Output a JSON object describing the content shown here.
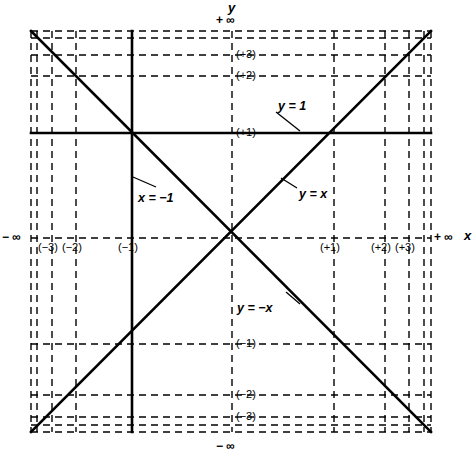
{
  "figure": {
    "kind": "compactified-cartesian-plane",
    "background": "#ffffff",
    "ink": "#000000",
    "width": 475,
    "height": 460
  },
  "axis_titles": {
    "y_axis": "y",
    "x_axis": "x"
  },
  "infinity_labels": {
    "top": "+ ∞",
    "bottom": "− ∞",
    "left": "− ∞",
    "right": "+ ∞"
  },
  "x_tick_labels": [
    {
      "text": "(−3)",
      "value": -3,
      "px": 52
    },
    {
      "text": "(−2)",
      "value": -2,
      "px": 76
    },
    {
      "text": "(−1)",
      "value": -1,
      "px": 132
    },
    {
      "text": "(+1)",
      "value": 1,
      "px": 334
    },
    {
      "text": "(+2)",
      "value": 2,
      "px": 385
    },
    {
      "text": "(+3)",
      "value": 3,
      "px": 409
    }
  ],
  "y_tick_labels": [
    {
      "text": "(+3)",
      "value": 3,
      "px": 55
    },
    {
      "text": "(+2)",
      "value": 2,
      "px": 76
    },
    {
      "text": "(+1)",
      "value": 1,
      "px": 133
    },
    {
      "text": "(−1)",
      "value": -1,
      "px": 344
    },
    {
      "text": "(−2)",
      "value": -2,
      "px": 395
    },
    {
      "text": "(−3)",
      "value": -3,
      "px": 417
    }
  ],
  "curve_labels": [
    {
      "id": "y-equals-1",
      "text": "y = 1",
      "x": 278,
      "y": 100
    },
    {
      "id": "x-equals-m1",
      "text": "x = −1",
      "x": 138,
      "y": 192
    },
    {
      "id": "y-equals-x",
      "text": "y = x",
      "x": 299,
      "y": 188
    },
    {
      "id": "y-equals-mx",
      "text": "y = −x",
      "x": 237,
      "y": 302
    }
  ],
  "chart_data": {
    "type": "line",
    "title": "",
    "xlabel": "x",
    "ylabel": "y",
    "grid": true,
    "legend": "inline-annotations",
    "xlim": [
      "-inf",
      "+inf"
    ],
    "ylim": [
      "-inf",
      "+inf"
    ],
    "origin_px": {
      "x": 232,
      "y": 238
    },
    "frame_px": {
      "left": 31,
      "right": 431,
      "top": 31,
      "bottom": 432
    },
    "x_gridlines_px": [
      31,
      37,
      52,
      76,
      132,
      232,
      334,
      385,
      409,
      424,
      431
    ],
    "y_gridlines_px": [
      31,
      38,
      55,
      76,
      133,
      238,
      344,
      395,
      417,
      425,
      432
    ],
    "series": [
      {
        "name": "y = 1",
        "style": "solid",
        "kind": "horizontal-line",
        "y_value": 1,
        "from_px": [
          31,
          133
        ],
        "to_px": [
          431,
          133
        ]
      },
      {
        "name": "x = −1",
        "style": "solid",
        "kind": "vertical-line",
        "x_value": -1,
        "from_px": [
          132,
          31
        ],
        "to_px": [
          132,
          432
        ]
      },
      {
        "name": "y = x",
        "style": "solid",
        "kind": "diagonal",
        "slope": 1,
        "from_px": [
          31,
          432
        ],
        "to_px": [
          431,
          31
        ]
      },
      {
        "name": "y = −x",
        "style": "solid",
        "kind": "diagonal",
        "slope": -1,
        "from_px": [
          31,
          31
        ],
        "to_px": [
          431,
          432
        ]
      }
    ]
  }
}
